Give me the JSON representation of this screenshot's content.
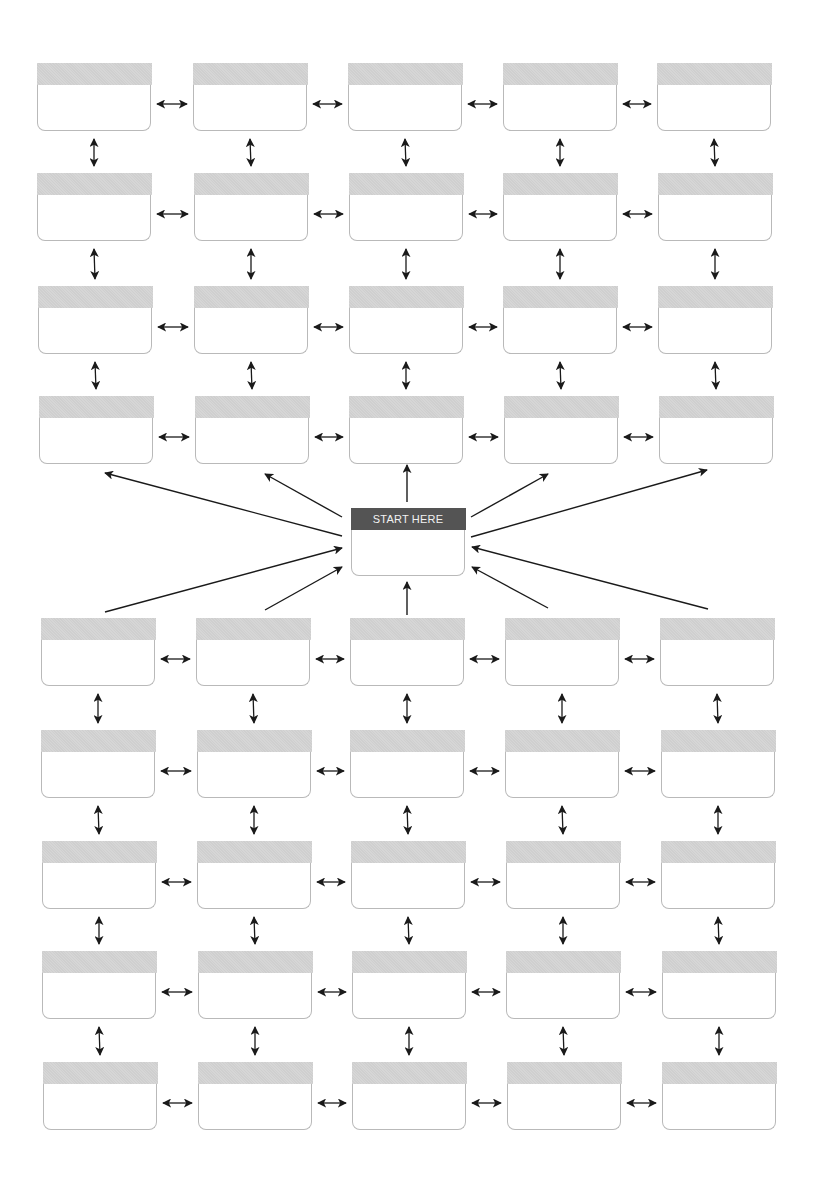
{
  "diagram": {
    "title": "",
    "start_box": {
      "label": "START HERE",
      "x": 351,
      "y": 508,
      "header_color": "#545454"
    },
    "colors": {
      "box_border": "#b9b9b9",
      "header_fill": "#d2d2d2",
      "arrow": "#1a1a1a"
    },
    "box_size": {
      "w": 114,
      "h": 68,
      "header_h": 22
    },
    "top_grid": {
      "rows": [
        {
          "y": 63,
          "xs": [
            37,
            193,
            348,
            503,
            657
          ]
        },
        {
          "y": 173,
          "xs": [
            37,
            194,
            349,
            503,
            658
          ]
        },
        {
          "y": 286,
          "xs": [
            38,
            194,
            349,
            503,
            658
          ]
        },
        {
          "y": 396,
          "xs": [
            39,
            195,
            349,
            504,
            659
          ]
        }
      ]
    },
    "bottom_grid": {
      "rows": [
        {
          "y": 618,
          "xs": [
            41,
            196,
            350,
            505,
            660
          ]
        },
        {
          "y": 730,
          "xs": [
            41,
            197,
            350,
            505,
            661
          ]
        },
        {
          "y": 841,
          "xs": [
            42,
            197,
            351,
            506,
            661
          ]
        },
        {
          "y": 951,
          "xs": [
            42,
            198,
            352,
            506,
            662
          ]
        },
        {
          "y": 1062,
          "xs": [
            43,
            198,
            352,
            507,
            662
          ]
        }
      ]
    },
    "radial_arrows": [
      {
        "from": [
          342,
          536
        ],
        "to": [
          105,
          473
        ]
      },
      {
        "from": [
          342,
          517
        ],
        "to": [
          265,
          474
        ]
      },
      {
        "from": [
          407,
          502
        ],
        "to": [
          407,
          465
        ]
      },
      {
        "from": [
          471,
          517
        ],
        "to": [
          548,
          474
        ]
      },
      {
        "from": [
          471,
          537
        ],
        "to": [
          707,
          470
        ]
      },
      {
        "from": [
          105,
          612
        ],
        "to": [
          342,
          548
        ]
      },
      {
        "from": [
          265,
          610
        ],
        "to": [
          342,
          567
        ]
      },
      {
        "from": [
          407,
          615
        ],
        "to": [
          407,
          582
        ]
      },
      {
        "from": [
          548,
          608
        ],
        "to": [
          472,
          567
        ]
      },
      {
        "from": [
          708,
          609
        ],
        "to": [
          472,
          547
        ]
      }
    ],
    "connector_style": "double-headed arrows between adjacent boxes (horizontal and vertical)"
  }
}
